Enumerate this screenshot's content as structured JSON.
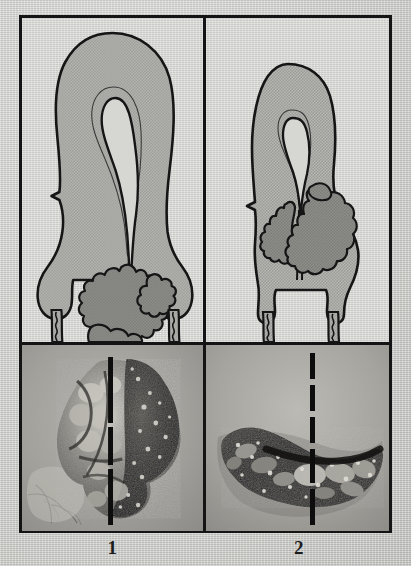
{
  "figure": {
    "columns": [
      {
        "caption": "1",
        "diagram": {
          "name": "uterus-diagram-fundal-tumor",
          "description": "Sagittal cross-section of uterus with large lobulated tumor mass occupying the lower uterine segment and cervix",
          "organ_label": "uterus",
          "cavity_label": "endometrial cavity",
          "tumor_label": "tumor mass",
          "vagina_label": "vaginal wall"
        },
        "photo": {
          "name": "gross-specimen-photo-1",
          "description": "Gross pathology photograph of bulky exophytic lobulated tumor specimen",
          "overlay_line": "dashed midline reference"
        }
      },
      {
        "caption": "2",
        "diagram": {
          "name": "uterus-diagram-cervical-tumor",
          "description": "Sagittal cross-section of uterus with tumor mass infiltrating the posterior cervix and lower segment",
          "organ_label": "uterus",
          "cavity_label": "endometrial cavity",
          "tumor_label": "tumor mass",
          "vagina_label": "vaginal wall"
        },
        "photo": {
          "name": "gross-specimen-photo-2",
          "description": "Gross pathology photograph of elongated flattened tumor specimen",
          "overlay_line": "dashed midline reference"
        }
      }
    ],
    "colors": {
      "frame": "#141414",
      "paper": "#cfcfcc",
      "diagram_background": "#d6d6d3",
      "organ_fill": "#ababa8",
      "tumor_fill": "#8a8a87",
      "outline": "#151515",
      "photo_background": "#9a9a96",
      "overlay_line": "#101010"
    }
  }
}
